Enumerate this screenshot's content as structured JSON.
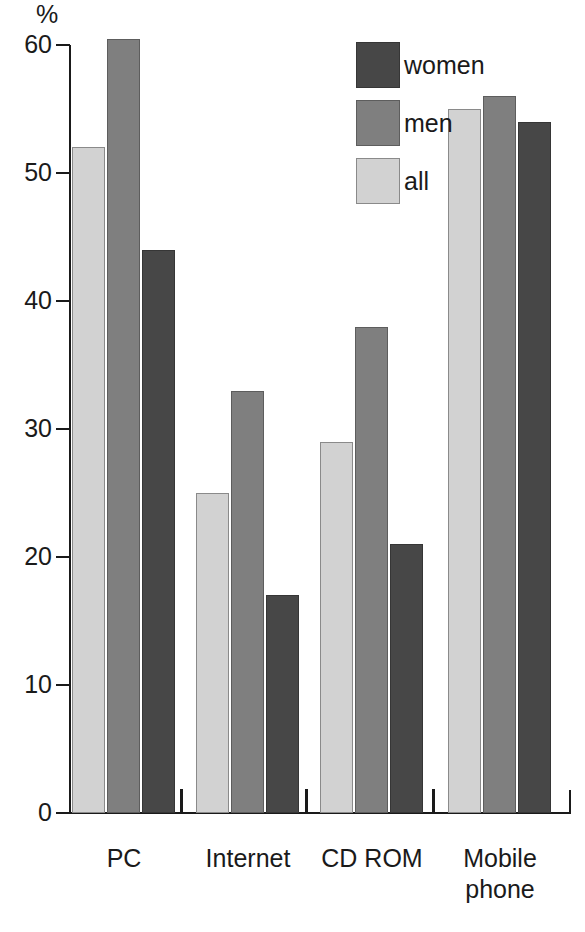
{
  "chart_data": {
    "type": "bar",
    "title": "",
    "subtitle": "",
    "xlabel": "",
    "ylabel": "%",
    "unit_label": "%",
    "categories": [
      "PC",
      "Internet",
      "CD ROM",
      "Mobile\nphone"
    ],
    "series": [
      {
        "name": "all",
        "color": "#d2d2d2",
        "values": [
          52,
          25,
          29,
          55
        ]
      },
      {
        "name": "men",
        "color": "#7f7f7f",
        "values": [
          60.5,
          33,
          38,
          56
        ]
      },
      {
        "name": "women",
        "color": "#474747",
        "values": [
          44,
          17,
          21,
          54
        ]
      }
    ],
    "series_order_in_plot": [
      "all",
      "men",
      "women"
    ],
    "legend_order": [
      "women",
      "men",
      "all"
    ],
    "ylim": [
      0,
      60
    ],
    "yticks": [
      0,
      10,
      20,
      30,
      40,
      50,
      60
    ],
    "ytick_labels": [
      "0",
      "10",
      "20",
      "30",
      "40",
      "50",
      "60"
    ],
    "grid": false,
    "legend_position": "top-right"
  },
  "legend": {
    "entries": [
      {
        "label": "women",
        "key": "women"
      },
      {
        "label": "men",
        "key": "men"
      },
      {
        "label": "all",
        "key": "all"
      }
    ]
  },
  "axis": {
    "unit": "%",
    "tick_labels": [
      "60",
      "50",
      "40",
      "30",
      "20",
      "10",
      "0"
    ]
  },
  "categories": [
    {
      "label": "PC"
    },
    {
      "label": "Internet"
    },
    {
      "label": "CD ROM"
    },
    {
      "label": "Mobile\nphone"
    }
  ]
}
